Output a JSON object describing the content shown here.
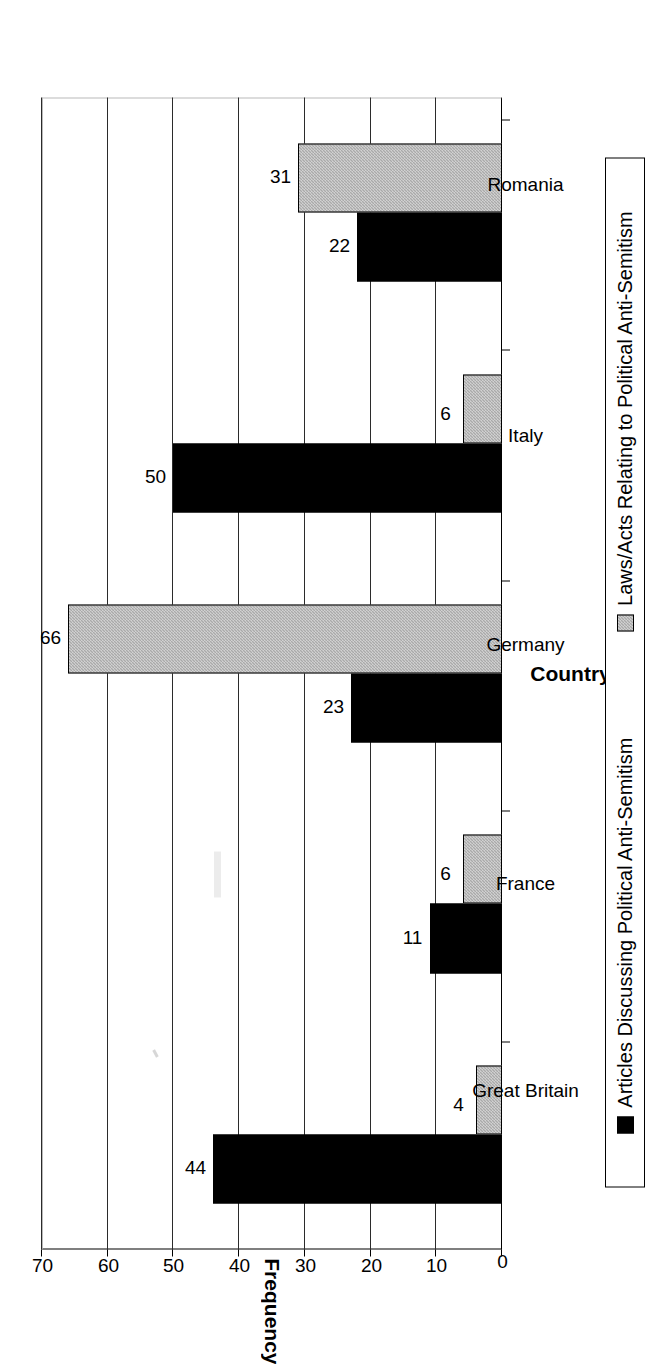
{
  "chart_data": {
    "type": "bar",
    "title": "",
    "xlabel": "Country",
    "ylabel": "Frequency",
    "ylim": [
      0,
      70
    ],
    "yticks": [
      0,
      10,
      20,
      30,
      40,
      50,
      60,
      70
    ],
    "grid": true,
    "legend_position": "bottom",
    "orientation": "rotated-90",
    "categories": [
      "Great Britain",
      "France",
      "Germany",
      "Italy",
      "Romania"
    ],
    "series": [
      {
        "name": "Articles Discussing Political Anti-Semitism",
        "color": "#000000",
        "values": [
          44,
          11,
          23,
          50,
          22
        ]
      },
      {
        "name": "Laws/Acts Relating to Political Anti-Semitism",
        "color": "#a9a9a9",
        "values": [
          4,
          6,
          66,
          6,
          31
        ]
      }
    ]
  },
  "axes": {
    "y_title": "Frequency",
    "x_title": "Country",
    "y_tick_labels": [
      "0",
      "10",
      "20",
      "30",
      "40",
      "50",
      "60",
      "70"
    ],
    "x_tick_labels": [
      "Great Britain",
      "France",
      "Germany",
      "Italy",
      "Romania"
    ]
  },
  "value_labels": {
    "great_britain": {
      "series0": "44",
      "series1": "4"
    },
    "france": {
      "series0": "11",
      "series1": "6"
    },
    "germany": {
      "series0": "23",
      "series1": "66"
    },
    "italy": {
      "series0": "50",
      "series1": "6"
    },
    "romania": {
      "series0": "22",
      "series1": "31"
    }
  },
  "legend": {
    "items": [
      {
        "label": "Articles Discussing Political Anti-Semitism",
        "swatch": "black-square-icon"
      },
      {
        "label": "Laws/Acts Relating to Political Anti-Semitism",
        "swatch": "gray-hatched-square-icon"
      }
    ]
  }
}
